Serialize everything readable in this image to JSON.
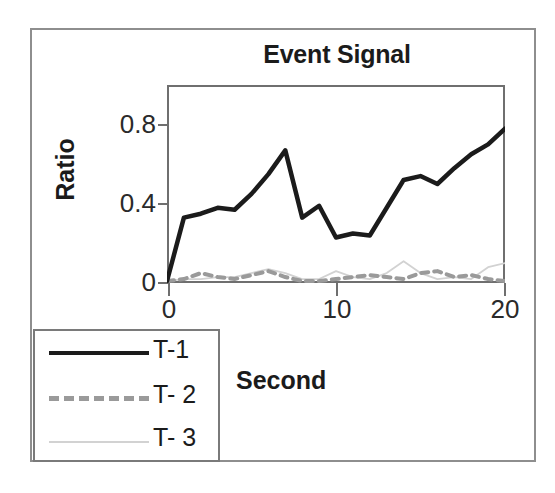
{
  "chart_data": {
    "type": "line",
    "title": "Event Signal",
    "xlabel": "Second",
    "ylabel": "Ratio",
    "xlim": [
      0,
      20
    ],
    "ylim": [
      0,
      1.0
    ],
    "xticks": [
      "0",
      "10",
      "20"
    ],
    "xtick_values": [
      0,
      10,
      20
    ],
    "yticks": [
      "0",
      "0.4",
      "0.8"
    ],
    "ytick_values": [
      0,
      0.4,
      0.8
    ],
    "grid": false,
    "legend_position": "bottom-left-outside",
    "x": [
      0,
      1,
      2,
      3,
      4,
      5,
      6,
      7,
      8,
      9,
      10,
      11,
      12,
      13,
      14,
      15,
      16,
      17,
      18,
      19,
      20
    ],
    "series": [
      {
        "name": "T-1",
        "color": "#1b1b1b",
        "style": "solid",
        "values": [
          0.01,
          0.33,
          0.35,
          0.38,
          0.37,
          0.45,
          0.55,
          0.67,
          0.33,
          0.39,
          0.23,
          0.25,
          0.24,
          0.38,
          0.52,
          0.54,
          0.5,
          0.58,
          0.65,
          0.7,
          0.78
        ]
      },
      {
        "name": "T- 2",
        "color": "#9a9a9a",
        "style": "dashed",
        "values": [
          0.01,
          0.02,
          0.05,
          0.03,
          0.02,
          0.04,
          0.06,
          0.03,
          0.01,
          0.01,
          0.02,
          0.03,
          0.04,
          0.03,
          0.02,
          0.05,
          0.06,
          0.03,
          0.04,
          0.02,
          0.01
        ]
      },
      {
        "name": "T- 3",
        "color": "#d2d2d2",
        "style": "thin",
        "values": [
          0.01,
          0.02,
          0.02,
          0.03,
          0.03,
          0.05,
          0.07,
          0.05,
          0.02,
          0.02,
          0.06,
          0.03,
          0.02,
          0.05,
          0.11,
          0.05,
          0.02,
          0.03,
          0.02,
          0.08,
          0.1
        ]
      }
    ]
  },
  "legend": {
    "items": [
      {
        "label": "T-1"
      },
      {
        "label": "T- 2"
      },
      {
        "label": "T- 3"
      }
    ]
  }
}
